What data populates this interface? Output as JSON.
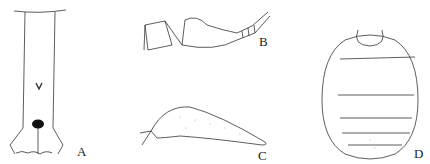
{
  "figure": {
    "panels": [
      {
        "id": "A",
        "label": "A",
        "subject": "elongated segment with dark spot and V-mark"
      },
      {
        "id": "B",
        "label": "B",
        "subject": "antenna / appendage in lateral view"
      },
      {
        "id": "C",
        "label": "C",
        "subject": "stippled lobe-shaped structure"
      },
      {
        "id": "D",
        "label": "D",
        "subject": "segmented abdomen, dorsal view"
      }
    ],
    "colors": {
      "line": "#333333",
      "stipple": "#999999",
      "background": "#ffffff"
    }
  }
}
